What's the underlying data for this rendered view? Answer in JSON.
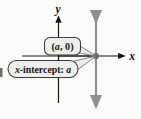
{
  "figure": {
    "kind": "x-intercept-coordinate-diagram",
    "background_color": "#fbfbfa",
    "axes": {
      "axis_color": "#15140f",
      "y_axis_label": "y",
      "x_axis_label": "x",
      "origin_px": {
        "x": 58,
        "y": 56
      }
    },
    "guide_lines": {
      "color": "#8e8e8e",
      "vertical_label": "vertical-line-through-intercept",
      "horizontal_label": "horizontal-line-to-intercept"
    },
    "point": {
      "name": "x-intercept-point",
      "color": "#6f6f6f",
      "px": {
        "x": 96,
        "y": 56
      }
    },
    "callouts": [
      {
        "id": "ordered-pair",
        "text": "(a, 0)",
        "fill": "#eeeeec",
        "stroke": "#3a3a36"
      },
      {
        "id": "x-intercept",
        "text_prefix": "x",
        "text_middle": "-intercept: ",
        "text_value": "a",
        "text_full": "x-intercept: a",
        "fill": "#eeeeec",
        "stroke": "#3a3a36"
      }
    ]
  }
}
